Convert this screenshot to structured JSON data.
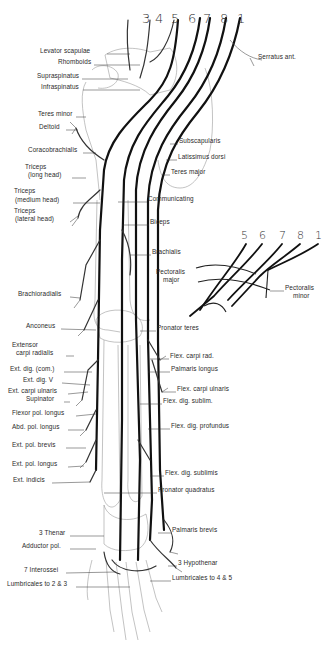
{
  "figure": {
    "segment_numbers_main": [
      "3",
      "4",
      "5",
      "6",
      "7",
      "8",
      "1"
    ],
    "segment_numbers_inset": [
      "5",
      "6",
      "7",
      "8",
      "1"
    ],
    "labels_left": [
      {
        "id": "levator",
        "text": "Levator scapulae",
        "x": 40,
        "y": 51
      },
      {
        "id": "rhomboids",
        "text": "Rhomboids",
        "x": 58,
        "y": 62
      },
      {
        "id": "supraspinatus",
        "text": "Supraspinatus",
        "x": 37,
        "y": 76
      },
      {
        "id": "infraspinatus",
        "text": "Infraspinatus",
        "x": 41,
        "y": 87
      },
      {
        "id": "teres-minor",
        "text": "Teres minor",
        "x": 38,
        "y": 114
      },
      {
        "id": "deltoid",
        "text": "Deltoid",
        "x": 39,
        "y": 127
      },
      {
        "id": "coracobrachialis",
        "text": "Coracobrachialis",
        "x": 28,
        "y": 150
      },
      {
        "id": "triceps-long",
        "text": "Triceps",
        "x": 25,
        "y": 167
      },
      {
        "id": "triceps-long-2",
        "text": "(long head)",
        "x": 28,
        "y": 175
      },
      {
        "id": "triceps-medium",
        "text": "Triceps",
        "x": 14,
        "y": 191
      },
      {
        "id": "triceps-medium-2",
        "text": "(medium head)",
        "x": 15,
        "y": 200
      },
      {
        "id": "triceps-lateral",
        "text": "Triceps",
        "x": 14,
        "y": 211
      },
      {
        "id": "triceps-lateral-2",
        "text": "(lateral head)",
        "x": 15,
        "y": 219
      },
      {
        "id": "brachioradialis",
        "text": "Brachioradialis",
        "x": 18,
        "y": 294
      },
      {
        "id": "anconeus",
        "text": "Anconeus",
        "x": 26,
        "y": 326
      },
      {
        "id": "ext-carpi-rad",
        "text": "Extensor",
        "x": 12,
        "y": 345
      },
      {
        "id": "ext-carpi-rad-2",
        "text": "carpi radialis",
        "x": 16,
        "y": 353
      },
      {
        "id": "ext-dig-com",
        "text": "Ext. dig. (com.)",
        "x": 10,
        "y": 369
      },
      {
        "id": "ext-dig-v",
        "text": "Ext. dig. V",
        "x": 23,
        "y": 380
      },
      {
        "id": "ext-carpi-uln",
        "text": "Ext. carpi ulnaris",
        "x": 8,
        "y": 391
      },
      {
        "id": "supinator",
        "text": "Supinator",
        "x": 26,
        "y": 399
      },
      {
        "id": "flexor-pol-longus",
        "text": "Flexor pol. longus",
        "x": 12,
        "y": 413
      },
      {
        "id": "abd-pol-longus",
        "text": "Abd. pol. longus",
        "x": 12,
        "y": 427
      },
      {
        "id": "ext-pol-brevis",
        "text": "Ext. pol. brevis",
        "x": 12,
        "y": 445
      },
      {
        "id": "ext-pol-longus",
        "text": "Ext. pol. longus",
        "x": 12,
        "y": 464
      },
      {
        "id": "ext-indicis",
        "text": "Ext. indicis",
        "x": 13,
        "y": 480
      },
      {
        "id": "thenar",
        "text": "3 Thenar",
        "x": 39,
        "y": 533
      },
      {
        "id": "adductor-pol",
        "text": "Adductor pol.",
        "x": 22,
        "y": 546
      },
      {
        "id": "interossei",
        "text": "7 Interossei",
        "x": 24,
        "y": 570
      },
      {
        "id": "lumbricales-23",
        "text": "Lumbricales to 2 & 3",
        "x": 7,
        "y": 584
      }
    ],
    "labels_right": [
      {
        "id": "serratus",
        "text": "Serratus ant.",
        "x": 258,
        "y": 57
      },
      {
        "id": "subscapularis",
        "text": "Subscapularis",
        "x": 179,
        "y": 141
      },
      {
        "id": "latissimus",
        "text": "Latissimus dorsi",
        "x": 178,
        "y": 157
      },
      {
        "id": "teres-major",
        "text": "Teres major",
        "x": 171,
        "y": 172
      },
      {
        "id": "communicating",
        "text": "Communicating",
        "x": 148,
        "y": 199
      },
      {
        "id": "biceps",
        "text": "Biceps",
        "x": 150,
        "y": 222
      },
      {
        "id": "brachialis",
        "text": "Brachialis",
        "x": 152,
        "y": 252
      },
      {
        "id": "pectoralis-major",
        "text": "Pectoralis",
        "x": 156,
        "y": 272
      },
      {
        "id": "pectoralis-major-2",
        "text": "major",
        "x": 163,
        "y": 280
      },
      {
        "id": "pectoralis-minor",
        "text": "Pectoralis",
        "x": 285,
        "y": 288
      },
      {
        "id": "pectoralis-minor-2",
        "text": "minor",
        "x": 293,
        "y": 296
      },
      {
        "id": "pronator-teres",
        "text": "Pronator teres",
        "x": 157,
        "y": 328
      },
      {
        "id": "flex-carpi-rad",
        "text": "Flex. carpi rad.",
        "x": 170,
        "y": 356
      },
      {
        "id": "palmaris-longus",
        "text": "Palmaris longus",
        "x": 171,
        "y": 369
      },
      {
        "id": "flex-carpi-uln",
        "text": "Flex. carpi ulnaris",
        "x": 177,
        "y": 389
      },
      {
        "id": "flex-dig-sublim",
        "text": "Flex. dig. sublim.",
        "x": 163,
        "y": 401
      },
      {
        "id": "flex-dig-prof",
        "text": "Flex. dig. profundus",
        "x": 171,
        "y": 426
      },
      {
        "id": "flex-dig-sublimis",
        "text": "Flex. dig. sublimis",
        "x": 165,
        "y": 473
      },
      {
        "id": "pronator-quad",
        "text": "Pronator quadratus",
        "x": 158,
        "y": 490
      },
      {
        "id": "palmaris-brevis",
        "text": "Palmaris brevis",
        "x": 172,
        "y": 530
      },
      {
        "id": "hypothenar",
        "text": "3 Hypothenar",
        "x": 178,
        "y": 563
      },
      {
        "id": "lumbricales-45",
        "text": "Lumbricales to 4 & 5",
        "x": 172,
        "y": 578
      }
    ]
  }
}
